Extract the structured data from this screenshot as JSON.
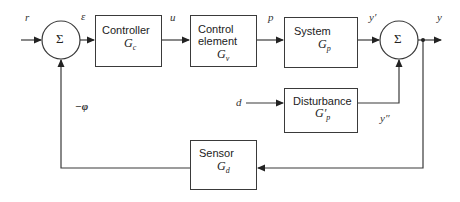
{
  "diagram": {
    "type": "feedback-control-block-diagram",
    "blocks": [
      {
        "id": "controller",
        "label": "Controller",
        "tf": "G",
        "sub": "c"
      },
      {
        "id": "control_element",
        "label_line1": "Control",
        "label_line2": "element",
        "tf": "G",
        "sub": "v"
      },
      {
        "id": "system",
        "label": "System",
        "tf": "G",
        "sub": "p"
      },
      {
        "id": "disturbance",
        "label": "Disturbance",
        "tf": "G′",
        "sub": "p"
      },
      {
        "id": "sensor",
        "label": "Sensor",
        "tf": "G",
        "sub": "d"
      }
    ],
    "summers": [
      {
        "id": "sum1",
        "symbol": "Σ"
      },
      {
        "id": "sum2",
        "symbol": "Σ"
      }
    ],
    "signals": {
      "r": "r",
      "epsilon": "ε",
      "u": "u",
      "p": "p",
      "y_prime": "y′",
      "y": "y",
      "d": "d",
      "y_dprime": "y″",
      "neg_phi": "−φ"
    },
    "colors": {
      "line": "#3a3a3a",
      "background": "#ffffff"
    }
  }
}
